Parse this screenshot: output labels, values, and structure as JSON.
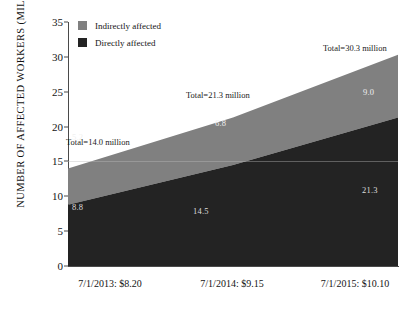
{
  "chart_data": {
    "type": "area",
    "title": "",
    "subtitle": "",
    "xlabel": "",
    "ylabel": "NUMBER OF AFFECTED WORKERS (MILLIONS)",
    "ylim": [
      0,
      35
    ],
    "yticks": [
      0,
      5,
      10,
      15,
      20,
      25,
      30,
      35
    ],
    "ytick_labels": [
      "0",
      "5",
      "10",
      "15",
      "20",
      "25",
      "30",
      "35"
    ],
    "grid": false,
    "legend_position": "top-left",
    "categories": [
      "7/1/2013: $8.20",
      "7/1/2014: $9.15",
      "7/1/2015: $10.10"
    ],
    "x": [
      0,
      1,
      2
    ],
    "series": [
      {
        "name": "Directly affected",
        "values": [
          8.8,
          14.5,
          21.3
        ],
        "color": "#232323",
        "point_labels": [
          "8.8",
          "14.5",
          "21.3"
        ]
      },
      {
        "name": "Indirectly affected",
        "values": [
          5.2,
          6.8,
          9.0
        ],
        "color": "#808080",
        "point_labels": [
          "5.2",
          "6.8",
          "9.0"
        ]
      }
    ],
    "totals": [
      14.0,
      21.3,
      30.3
    ],
    "annotations": [
      {
        "text": "Total=14.0 million",
        "x": 0.0,
        "y": 18.0
      },
      {
        "text": "Total=21.3 million",
        "x": 1.0,
        "y": 25.0
      },
      {
        "text": "Total=30.3 million",
        "x": 2.0,
        "y": 32.0
      }
    ]
  },
  "axis": {
    "y_title": "NUMBER OF AFFECTED WORKERS (MILLIONS)",
    "y_ticks": [
      "35",
      "30",
      "25",
      "20",
      "15",
      "10",
      "5",
      "0"
    ],
    "x_labels": [
      "7/1/2013: $8.20",
      "7/1/2014: $9.15",
      "7/1/2015: $10.10"
    ]
  },
  "legend": {
    "items": [
      {
        "label": "Indirectly affected",
        "color": "#808080"
      },
      {
        "label": "Directly affected",
        "color": "#232323"
      }
    ]
  },
  "data_labels": {
    "indirect": [
      "5.2",
      "6.8",
      "9.0"
    ],
    "direct": [
      "8.8",
      "14.5",
      "21.3"
    ]
  },
  "totals": {
    "left": "Total=14.0 million",
    "middle": "Total=21.3 million",
    "right": "Total=30.3 million"
  },
  "colors": {
    "indirect": "#808080",
    "direct": "#232323",
    "axis": "#4a4a4a",
    "background": "#ffffff"
  }
}
